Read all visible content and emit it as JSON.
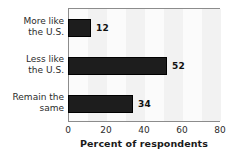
{
  "chart_data": {
    "type": "bar",
    "orientation": "horizontal",
    "title": "",
    "subtitle": "",
    "categories": [
      "More like the U.S.",
      "Less like the U.S.",
      "Remain the same"
    ],
    "category_lines": [
      [
        "More like",
        "the U.S."
      ],
      [
        "Less like",
        "the U.S."
      ],
      [
        "Remain the",
        "same"
      ]
    ],
    "values": [
      12,
      52,
      34
    ],
    "data_labels": [
      "12",
      "52",
      "34"
    ],
    "xlabel": "Percent of respondents",
    "ylabel": "",
    "xlim": [
      0,
      80
    ],
    "ylim": null,
    "xticks": [
      0,
      20,
      40,
      60,
      80
    ],
    "xtick_labels": [
      "0",
      "20",
      "40",
      "60",
      "80"
    ],
    "grid": false,
    "legend": null,
    "bar_color": "#1d1d1d",
    "plot_background": "#fbfbfb",
    "frame_color": "#8c8c8c",
    "text_color": "#2b2b2b"
  }
}
